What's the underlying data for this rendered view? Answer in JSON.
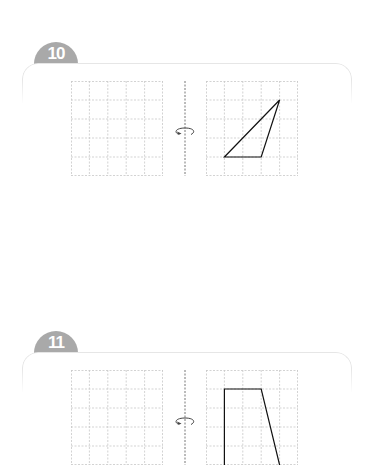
{
  "problems": [
    {
      "number": "10",
      "grid": {
        "cols": 5,
        "rows": 5
      },
      "axis": "vertical-dashed",
      "rotation_icon": "rotate-around-axis-icon",
      "shape": {
        "type": "triangle",
        "points": [
          [
            1,
            4
          ],
          [
            3,
            4
          ],
          [
            4,
            1
          ]
        ]
      }
    },
    {
      "number": "11",
      "grid": {
        "cols": 5,
        "rows": 5
      },
      "axis": "vertical-dashed",
      "rotation_icon": "rotate-around-axis-icon",
      "shape": {
        "type": "trapezoid-partial",
        "points": [
          [
            1,
            5
          ],
          [
            1,
            1
          ],
          [
            3,
            1
          ],
          [
            4,
            5
          ]
        ]
      }
    }
  ],
  "colors": {
    "badge": "#a9a9a9",
    "grid_line": "#c8c8c8",
    "card_border": "#e6e6e6",
    "shape_stroke": "#111111"
  }
}
